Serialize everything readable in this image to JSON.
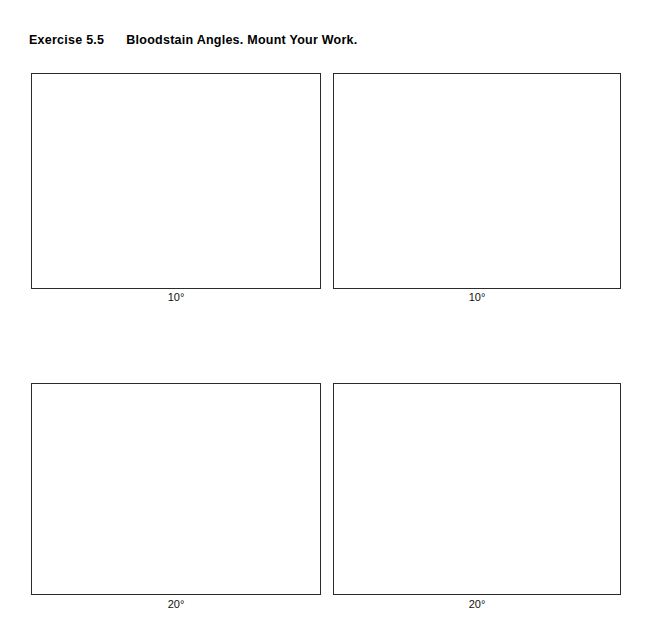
{
  "page": {
    "background_color": "#ffffff",
    "text_color": "#000000",
    "border_color": "#2b2b2b"
  },
  "header": {
    "exercise_number": "Exercise 5.5",
    "description": "Bloodstain Angles. Mount Your Work."
  },
  "boxes": [
    {
      "id": "box-top-left",
      "label": "10°",
      "row": 1,
      "column": 1
    },
    {
      "id": "box-top-right",
      "label": "10°",
      "row": 1,
      "column": 2
    },
    {
      "id": "box-bottom-left",
      "label": "20°",
      "row": 2,
      "column": 1
    },
    {
      "id": "box-bottom-right",
      "label": "20°",
      "row": 2,
      "column": 2
    }
  ]
}
